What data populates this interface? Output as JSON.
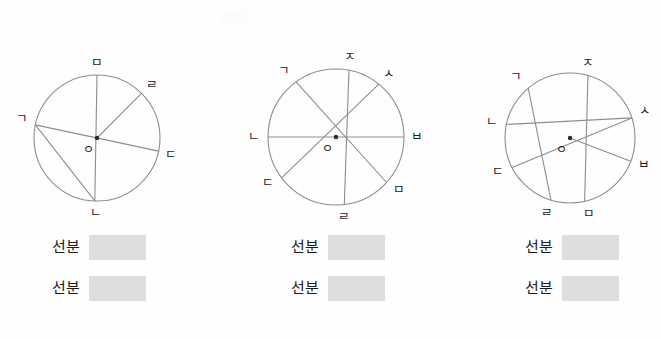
{
  "worksheet": {
    "title": "원의 반지름과 지름 찾기",
    "background_color": "#fefefe",
    "stroke_color": "#8d8d8d",
    "answer_box_color": "#dededf",
    "text_color": "#1c1c1c"
  },
  "figures": [
    {
      "id": "circle-1",
      "left": 0,
      "center": {
        "x": 97,
        "y": 98,
        "label": "ㅇ"
      },
      "radius": 63,
      "points": [
        {
          "name": "ㅁ",
          "angle_deg": 90,
          "label_dx": 0,
          "label_dy": -8
        },
        {
          "name": "ㄹ",
          "angle_deg": 45,
          "label_dx": 10,
          "label_dy": -4
        },
        {
          "name": "ㄱ",
          "angle_deg": 168,
          "label_dx": -13,
          "label_dy": -2
        },
        {
          "name": "ㄷ",
          "angle_deg": 348,
          "label_dx": 12,
          "label_dy": 8
        },
        {
          "name": "ㄴ",
          "angle_deg": 268,
          "label_dx": 1,
          "label_dy": 16
        }
      ],
      "segments": [
        {
          "from": "ㅁ",
          "to": "ㄴ",
          "through_center": true
        },
        {
          "from": "ㄱ",
          "to": "ㄷ",
          "through_center": true
        },
        {
          "from": "ㄹ",
          "to": "ㅇ",
          "through_center": false
        },
        {
          "from": "ㄱ",
          "to": "ㄴ",
          "through_center": false
        }
      ]
    },
    {
      "id": "circle-2",
      "left": 239,
      "center": {
        "x": 97,
        "y": 97,
        "label": "ㅇ"
      },
      "radius": 68,
      "points": [
        {
          "name": "ㅈ",
          "angle_deg": 79,
          "label_dx": 1,
          "label_dy": -9
        },
        {
          "name": "ㅅ",
          "angle_deg": 51,
          "label_dx": 10,
          "label_dy": -6
        },
        {
          "name": "ㄱ",
          "angle_deg": 126,
          "label_dx": -12,
          "label_dy": -7
        },
        {
          "name": "ㄴ",
          "angle_deg": 180,
          "label_dx": -14,
          "label_dy": 4
        },
        {
          "name": "ㅂ",
          "angle_deg": 0,
          "label_dx": 13,
          "label_dy": 4
        },
        {
          "name": "ㄷ",
          "angle_deg": 217,
          "label_dx": -14,
          "label_dy": 9
        },
        {
          "name": "ㅁ",
          "angle_deg": 318,
          "label_dx": 12,
          "label_dy": 11
        },
        {
          "name": "ㄹ",
          "angle_deg": 277,
          "label_dx": 0,
          "label_dy": 17
        }
      ],
      "segments": [
        {
          "from": "ㄴ",
          "to": "ㅂ",
          "through_center": true
        },
        {
          "from": "ㅈ",
          "to": "ㄹ",
          "through_center": false
        },
        {
          "from": "ㄱ",
          "to": "ㅁ",
          "through_center": false
        },
        {
          "from": "ㄷ",
          "to": "ㅅ",
          "through_center": false
        }
      ]
    },
    {
      "id": "circle-3",
      "left": 473,
      "center": {
        "x": 97,
        "y": 98,
        "label": "ㅇ"
      },
      "radius": 65,
      "points": [
        {
          "name": "ㅈ",
          "angle_deg": 74,
          "label_dx": 0,
          "label_dy": -9
        },
        {
          "name": "ㄱ",
          "angle_deg": 130,
          "label_dx": -12,
          "label_dy": -7
        },
        {
          "name": "ㅅ",
          "angle_deg": 18,
          "label_dx": 13,
          "label_dy": -3
        },
        {
          "name": "ㄴ",
          "angle_deg": 168,
          "label_dx": -14,
          "label_dy": 2
        },
        {
          "name": "ㄷ",
          "angle_deg": 207,
          "label_dx": -14,
          "label_dy": 8
        },
        {
          "name": "ㅂ",
          "angle_deg": 339,
          "label_dx": 13,
          "label_dy": 8
        },
        {
          "name": "ㄹ",
          "angle_deg": 253,
          "label_dx": -4,
          "label_dy": 17
        },
        {
          "name": "ㅁ",
          "angle_deg": 283,
          "label_dx": 4,
          "label_dy": 17
        }
      ],
      "segments": [
        {
          "from": "ㄷ",
          "to": "ㅅ",
          "through_center": true
        },
        {
          "from": "ㅈ",
          "to": "ㅁ",
          "through_center": true
        },
        {
          "from": "ㅇ",
          "to": "ㅂ",
          "through_center": false
        },
        {
          "from": "ㄴ",
          "to": "ㅅ",
          "through_center": false
        },
        {
          "from": "ㄱ",
          "to": "ㄹ",
          "through_center": false
        }
      ]
    }
  ],
  "answers": [
    {
      "group_left": 52,
      "rows": [
        {
          "label": "선분",
          "value": ""
        },
        {
          "label": "선분",
          "value": ""
        }
      ]
    },
    {
      "group_left": 291,
      "rows": [
        {
          "label": "선분",
          "value": ""
        },
        {
          "label": "선분",
          "value": ""
        }
      ]
    },
    {
      "group_left": 525,
      "rows": [
        {
          "label": "선분",
          "value": ""
        },
        {
          "label": "선분",
          "value": ""
        }
      ]
    }
  ]
}
